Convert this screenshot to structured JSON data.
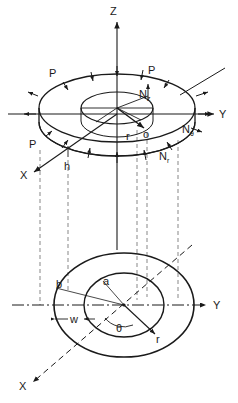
{
  "figure": {
    "background": "#ffffff",
    "stroke": "#1a1a1a",
    "width": 238,
    "height": 403
  },
  "upper_view": {
    "name": "isometric-annulus",
    "axes": [
      {
        "id": "z",
        "label": "Z",
        "style": "solid",
        "direction": "up"
      },
      {
        "id": "y",
        "label": "Y",
        "style": "solid",
        "direction": "right"
      },
      {
        "id": "x",
        "label": "X",
        "style": "solid",
        "direction": "down-left"
      }
    ],
    "load_labels": [
      {
        "id": "p-top-left",
        "label": "P"
      },
      {
        "id": "p-top-right",
        "label": "P"
      },
      {
        "id": "p-left",
        "label": "P"
      }
    ],
    "force_labels": [
      {
        "id": "nz",
        "base": "N",
        "sub": "z"
      },
      {
        "id": "ntheta",
        "base": "N",
        "sub": "θ"
      },
      {
        "id": "nr",
        "base": "N",
        "sub": "r"
      }
    ],
    "geometry_labels": [
      {
        "id": "thickness",
        "label": "h"
      },
      {
        "id": "radius-vector",
        "label": "r"
      },
      {
        "id": "origin",
        "label": "o"
      }
    ]
  },
  "lower_view": {
    "name": "plan-annulus",
    "axes": [
      {
        "id": "y",
        "label": "Y",
        "style": "dash-dot",
        "direction": "right"
      },
      {
        "id": "x",
        "label": "X",
        "style": "dashed",
        "direction": "down-left"
      }
    ],
    "dimension_labels": [
      {
        "id": "inner-radius",
        "label": "a"
      },
      {
        "id": "outer-radius",
        "label": "b"
      },
      {
        "id": "width",
        "label": "w"
      },
      {
        "id": "angle",
        "label": "θ"
      },
      {
        "id": "radius",
        "label": "r"
      }
    ]
  },
  "projection": {
    "name": "projection-lines",
    "count": 5,
    "style": "dashed"
  }
}
